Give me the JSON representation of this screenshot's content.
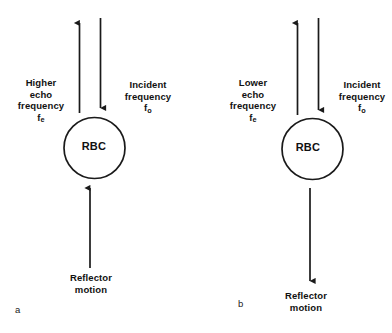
{
  "figure": {
    "stroke_color": "#1a1a1a",
    "text_color": "#111111",
    "background": "#ffffff"
  },
  "panels": [
    {
      "id": "a",
      "letter": "a",
      "cell_label": "RBC",
      "echo_label": {
        "line1": "Higher",
        "line2": "echo",
        "line3": "frequency",
        "symbol_base": "f",
        "symbol_sub": "e"
      },
      "incident_label": {
        "line1": "Incident",
        "line2": "frequency",
        "symbol_base": "f",
        "symbol_sub": "o"
      },
      "reflector_label": {
        "line1": "Reflector",
        "line2": "motion"
      },
      "arrows": {
        "echo_direction": "up",
        "incident_direction": "down",
        "reflector_direction": "up"
      }
    },
    {
      "id": "b",
      "letter": "b",
      "cell_label": "RBC",
      "echo_label": {
        "line1": "Lower",
        "line2": "echo",
        "line3": "frequency",
        "symbol_base": "f",
        "symbol_sub": "e"
      },
      "incident_label": {
        "line1": "Incident",
        "line2": "frequency",
        "symbol_base": "f",
        "symbol_sub": "o"
      },
      "reflector_label": {
        "line1": "Reflector",
        "line2": "motion"
      },
      "arrows": {
        "echo_direction": "up",
        "incident_direction": "down",
        "reflector_direction": "down"
      }
    }
  ]
}
